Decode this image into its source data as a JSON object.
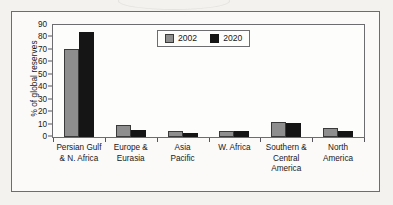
{
  "chart_data": {
    "type": "bar",
    "title": "",
    "xlabel": "",
    "ylabel": "% of global reserves",
    "ylim": [
      0,
      90
    ],
    "yticks": [
      0,
      10,
      20,
      30,
      40,
      50,
      60,
      70,
      80,
      90
    ],
    "grid": false,
    "legend_position": "top-center",
    "categories": [
      "Persian Gulf\n& N. Africa",
      "Europe &\nEurasia",
      "Asia\nPacific",
      "W. Africa",
      "Southern &\nCentral\nAmerica",
      "North\nAmerica"
    ],
    "category_lines": [
      [
        "Persian Gulf",
        "& N. Africa"
      ],
      [
        "Europe &",
        "Eurasia"
      ],
      [
        "Asia",
        "Pacific"
      ],
      [
        "W. Africa"
      ],
      [
        "Southern &",
        "Central",
        "America"
      ],
      [
        "North",
        "America"
      ]
    ],
    "series": [
      {
        "name": "2002",
        "color": "#8e8e8e",
        "values": [
          71,
          10,
          5,
          5,
          12,
          7.5
        ]
      },
      {
        "name": "2020",
        "color": "#151515",
        "values": [
          84,
          6,
          3,
          4.5,
          11.5,
          5
        ]
      }
    ]
  },
  "legend": {
    "items": [
      {
        "label": "2002",
        "swatch": "legend-swatch-2002"
      },
      {
        "label": "2020",
        "swatch": "legend-swatch-2020"
      }
    ]
  },
  "axes": {
    "y_title": "% of global reserves",
    "y_tick_labels": [
      "90",
      "80",
      "70",
      "60",
      "50",
      "40",
      "30",
      "20",
      "10",
      "0"
    ]
  }
}
